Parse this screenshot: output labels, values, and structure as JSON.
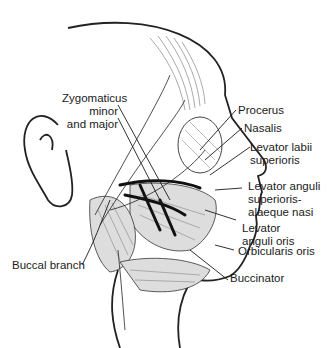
{
  "figure": {
    "labels": {
      "zygomaticus": [
        "Zygomaticus",
        "minor",
        "and major"
      ],
      "procerus": "Procerus",
      "nasalis": "Nasalis",
      "levator_labii": [
        "Levator labii",
        "superioris"
      ],
      "levator_anguli_sup": [
        "Levator anguli",
        "superioris-",
        "alaeque nasi"
      ],
      "levator_anguli_oris": [
        "Levator",
        "anguli oris"
      ],
      "orbicularis_oris": "Orbicularis oris",
      "buccinator": "Buccinator",
      "buccal_branch": "Buccal branch"
    },
    "colors": {
      "line": "#1a1a1a",
      "background": "#ffffff",
      "nerve": "#111111"
    }
  }
}
